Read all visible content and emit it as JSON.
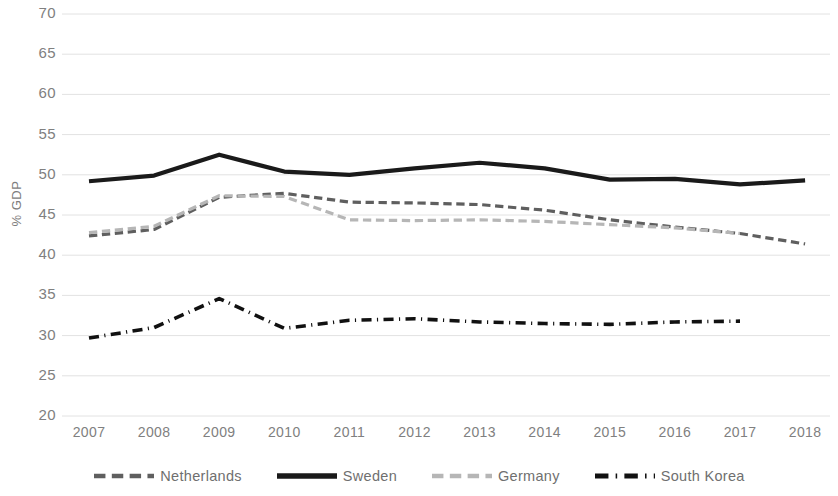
{
  "chart_data": {
    "type": "line",
    "title": "",
    "xlabel": "",
    "ylabel": "% GDP",
    "x": [
      2007,
      2008,
      2009,
      2010,
      2011,
      2012,
      2013,
      2014,
      2015,
      2016,
      2017,
      2018
    ],
    "xtick_labels": [
      "2007",
      "2008",
      "2009",
      "2010",
      "2011",
      "2012",
      "2013",
      "2014",
      "2015",
      "2016",
      "2017",
      "2018"
    ],
    "ytick_labels": [
      "70",
      "65",
      "60",
      "55",
      "50",
      "45",
      "40",
      "35",
      "30",
      "25",
      "20"
    ],
    "ylim": [
      20,
      70
    ],
    "ytick_step": 5,
    "grid": "horizontal",
    "legend_position": "bottom",
    "series": [
      {
        "name": "Netherlands",
        "style": "dashed",
        "color": "#5f5f5f",
        "width": 3.2,
        "values": [
          42.4,
          43.2,
          47.2,
          47.7,
          46.6,
          46.5,
          46.3,
          45.6,
          44.4,
          43.5,
          42.7,
          41.4
        ]
      },
      {
        "name": "Sweden",
        "style": "solid",
        "color": "#1a1a1a",
        "width": 4.2,
        "values": [
          49.2,
          49.9,
          52.5,
          50.4,
          50.0,
          50.8,
          51.5,
          50.8,
          49.4,
          49.5,
          48.8,
          49.3
        ]
      },
      {
        "name": "Germany",
        "style": "dashed",
        "color": "#b6b6b6",
        "width": 3.2,
        "values": [
          42.8,
          43.6,
          47.4,
          47.3,
          44.4,
          44.3,
          44.4,
          44.2,
          43.8,
          43.4,
          42.7,
          null
        ]
      },
      {
        "name": "South Korea",
        "style": "dashdot",
        "color": "#111111",
        "width": 3.6,
        "values": [
          29.7,
          31.0,
          34.6,
          30.9,
          31.9,
          32.1,
          31.7,
          31.5,
          31.4,
          31.7,
          31.8,
          null
        ]
      }
    ]
  },
  "legend": {
    "items": [
      {
        "label": "Netherlands",
        "icon": "dashed-line-icon"
      },
      {
        "label": "Sweden",
        "icon": "solid-line-icon"
      },
      {
        "label": "Germany",
        "icon": "dashed-light-line-icon"
      },
      {
        "label": "South Korea",
        "icon": "dashdot-line-icon"
      }
    ]
  }
}
